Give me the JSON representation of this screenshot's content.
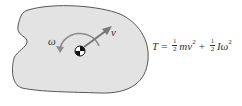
{
  "diagram": {
    "body": {
      "fill": "#e3e3e3",
      "stroke": "#444444"
    },
    "labels": {
      "omega": "ω",
      "velocity": "v"
    },
    "equation": {
      "lhs": "T",
      "equals": "=",
      "term1": {
        "coef_num": "1",
        "coef_den": "2",
        "symbol": "mv",
        "exp": "2"
      },
      "plus": "+",
      "term2": {
        "coef_num": "1",
        "coef_den": "2",
        "symbol": "Iω",
        "exp": "2"
      }
    }
  }
}
